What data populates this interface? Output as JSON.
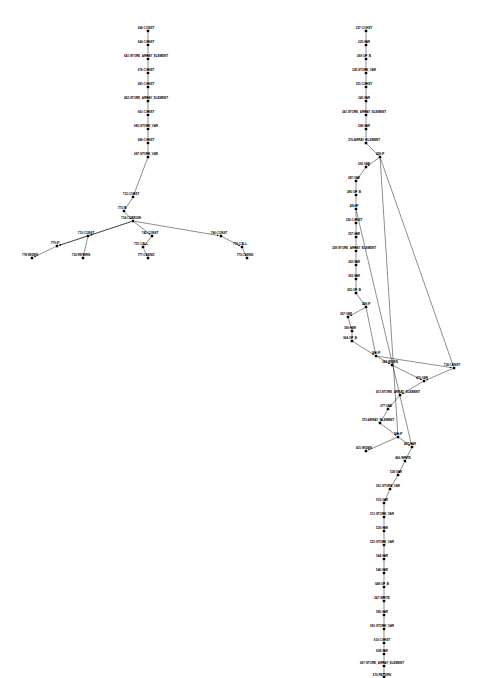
{
  "figure": {
    "kind": "control-flow-graph",
    "background": "#ffffff",
    "node_color": "#000000",
    "edge_color": "#000000",
    "node_shape": "square",
    "label_position": "left-of-node",
    "graph_count": 2,
    "note_bottom_node_clipped": true
  },
  "graphs": [
    {
      "id": "left-graph",
      "name": "left-control-flow-graph",
      "nodes": [
        {
          "id": "646",
          "label": "646:CONST",
          "x": 148,
          "y": 31,
          "lx": 146,
          "ly": 28.5,
          "anchor": "mid"
        },
        {
          "id": "640",
          "label": "640:CONST",
          "x": 148,
          "y": 45,
          "lx": 146,
          "ly": 42.5,
          "anchor": "mid"
        },
        {
          "id": "641",
          "label": "641:STORE_ARRAY_ELEMENT",
          "x": 148,
          "y": 59,
          "lx": 146,
          "ly": 56.5,
          "anchor": "mid"
        },
        {
          "id": "676",
          "label": "676:CONST",
          "x": 148,
          "y": 73,
          "lx": 146,
          "ly": 70.5,
          "anchor": "mid"
        },
        {
          "id": "681",
          "label": "681:CONST",
          "x": 148,
          "y": 87,
          "lx": 146,
          "ly": 84.5,
          "anchor": "mid"
        },
        {
          "id": "682",
          "label": "682:STORE_ARRAY_ELEMENT",
          "x": 148,
          "y": 101,
          "lx": 146,
          "ly": 98.5,
          "anchor": "mid"
        },
        {
          "id": "661",
          "label": "661:CONST",
          "x": 148,
          "y": 115,
          "lx": 146,
          "ly": 112.5,
          "anchor": "mid"
        },
        {
          "id": "680",
          "label": "680:STORE_VAR",
          "x": 148,
          "y": 129,
          "lx": 146,
          "ly": 126.5,
          "anchor": "mid"
        },
        {
          "id": "686",
          "label": "686:CONST",
          "x": 148,
          "y": 143,
          "lx": 146,
          "ly": 140.5,
          "anchor": "mid"
        },
        {
          "id": "687",
          "label": "687:STORE_VAR",
          "x": 148,
          "y": 157,
          "lx": 146,
          "ly": 154.5,
          "anchor": "mid"
        },
        {
          "id": "712",
          "label": "712:CONST",
          "x": 133,
          "y": 197,
          "lx": 131,
          "ly": 194.5,
          "anchor": "mid"
        },
        {
          "id": "773",
          "label": "773:IF",
          "x": 124,
          "y": 211,
          "lx": 122,
          "ly": 208.5,
          "anchor": "mid"
        },
        {
          "id": "714",
          "label": "714:CGBEGIN",
          "x": 133,
          "y": 221,
          "lx": 131,
          "ly": 218.5,
          "anchor": "mid"
        },
        {
          "id": "713",
          "label": "713:CONST",
          "x": 88,
          "y": 236,
          "lx": 86,
          "ly": 233.5,
          "anchor": "mid"
        },
        {
          "id": "742",
          "label": "742:CONST",
          "x": 152,
          "y": 236,
          "lx": 150,
          "ly": 233.5,
          "anchor": "mid"
        },
        {
          "id": "766",
          "label": "766:CONST",
          "x": 221,
          "y": 236,
          "lx": 219,
          "ly": 233.5,
          "anchor": "mid"
        },
        {
          "id": "779a",
          "label": "779:IF",
          "x": 57,
          "y": 246,
          "lx": 55,
          "ly": 243.5,
          "anchor": "mid"
        },
        {
          "id": "751",
          "label": "751:CALL",
          "x": 143,
          "y": 247,
          "lx": 141,
          "ly": 244.5,
          "anchor": "mid"
        },
        {
          "id": "776",
          "label": "776:CALL",
          "x": 242,
          "y": 247,
          "lx": 240,
          "ly": 244.5,
          "anchor": "mid"
        },
        {
          "id": "778",
          "label": "778:WIDEN",
          "x": 32,
          "y": 258,
          "lx": 30,
          "ly": 255.5,
          "anchor": "mid"
        },
        {
          "id": "732",
          "label": "732:RETURN",
          "x": 83,
          "y": 258,
          "lx": 81,
          "ly": 255.5,
          "anchor": "mid"
        },
        {
          "id": "777",
          "label": "777:CGEND",
          "x": 148,
          "y": 258,
          "lx": 146,
          "ly": 255.5,
          "anchor": "mid"
        },
        {
          "id": "775",
          "label": "775:CGEND",
          "x": 247,
          "y": 258,
          "lx": 245,
          "ly": 255.5,
          "anchor": "mid"
        }
      ],
      "edges": [
        [
          "646",
          "640"
        ],
        [
          "640",
          "641"
        ],
        [
          "641",
          "676"
        ],
        [
          "676",
          "681"
        ],
        [
          "681",
          "682"
        ],
        [
          "682",
          "661"
        ],
        [
          "661",
          "680"
        ],
        [
          "680",
          "686"
        ],
        [
          "686",
          "687"
        ],
        [
          "687",
          "712"
        ],
        [
          "712",
          "773"
        ],
        [
          "773",
          "714"
        ],
        [
          "714",
          "713"
        ],
        [
          "714",
          "742"
        ],
        [
          "714",
          "766"
        ],
        [
          "713",
          "779a"
        ],
        [
          "713",
          "732"
        ],
        [
          "742",
          "751"
        ],
        [
          "766",
          "776"
        ],
        [
          "779a",
          "778"
        ],
        [
          "751",
          "777"
        ],
        [
          "776",
          "775"
        ],
        [
          "714",
          "779a"
        ]
      ]
    },
    {
      "id": "right-graph",
      "name": "right-control-flow-graph",
      "nodes": [
        {
          "id": "227",
          "label": "227:CONST",
          "x": 366,
          "y": 31,
          "lx": 364,
          "ly": 28.5,
          "anchor": "mid"
        },
        {
          "id": "239",
          "label": "239:VAR",
          "x": 366,
          "y": 45,
          "lx": 364,
          "ly": 42.5,
          "anchor": "mid"
        },
        {
          "id": "299",
          "label": "299:OP_B",
          "x": 366,
          "y": 59,
          "lx": 364,
          "ly": 56.5,
          "anchor": "mid"
        },
        {
          "id": "338",
          "label": "338:STORE_VAR",
          "x": 366,
          "y": 73,
          "lx": 364,
          "ly": 70.5,
          "anchor": "mid"
        },
        {
          "id": "351",
          "label": "351:CONST",
          "x": 366,
          "y": 87,
          "lx": 364,
          "ly": 84.5,
          "anchor": "mid"
        },
        {
          "id": "342",
          "label": "342:VAR",
          "x": 366,
          "y": 101,
          "lx": 364,
          "ly": 98.5,
          "anchor": "mid"
        },
        {
          "id": "341",
          "label": "341:STORE_ARRAY_ELEMENT",
          "x": 366,
          "y": 115,
          "lx": 364,
          "ly": 112.5,
          "anchor": "mid"
        },
        {
          "id": "298",
          "label": "298:VAR",
          "x": 366,
          "y": 129,
          "lx": 364,
          "ly": 126.5,
          "anchor": "mid"
        },
        {
          "id": "276",
          "label": "276:ARRAY_ELEMENT",
          "x": 366,
          "y": 143,
          "lx": 364,
          "ly": 140.5,
          "anchor": "mid"
        },
        {
          "id": "328",
          "label": "328:IF",
          "x": 380,
          "y": 157,
          "lx": 380,
          "ly": 154.5,
          "anchor": "mid"
        },
        {
          "id": "292",
          "label": "292:VAR",
          "x": 366,
          "y": 167,
          "lx": 364,
          "ly": 164.5,
          "anchor": "mid"
        },
        {
          "id": "287",
          "label": "287:VAR",
          "x": 356,
          "y": 181,
          "lx": 354,
          "ly": 178.5,
          "anchor": "mid"
        },
        {
          "id": "286",
          "label": "286:OP_B",
          "x": 356,
          "y": 195,
          "lx": 354,
          "ly": 192.5,
          "anchor": "mid"
        },
        {
          "id": "426",
          "label": "426:IF",
          "x": 356,
          "y": 209,
          "lx": 354,
          "ly": 206.5,
          "anchor": "mid"
        },
        {
          "id": "336",
          "label": "336:CONST",
          "x": 356,
          "y": 223,
          "lx": 354,
          "ly": 220.5,
          "anchor": "mid"
        },
        {
          "id": "357",
          "label": "357:VAR",
          "x": 356,
          "y": 237,
          "lx": 354,
          "ly": 234.5,
          "anchor": "mid"
        },
        {
          "id": "328b",
          "label": "328:STORE_ARRAY_ELEMENT",
          "x": 356,
          "y": 251,
          "lx": 354,
          "ly": 248.5,
          "anchor": "mid"
        },
        {
          "id": "362",
          "label": "362:VAR",
          "x": 356,
          "y": 265,
          "lx": 354,
          "ly": 262.5,
          "anchor": "mid"
        },
        {
          "id": "363",
          "label": "363:VAR",
          "x": 356,
          "y": 279,
          "lx": 354,
          "ly": 276.5,
          "anchor": "mid"
        },
        {
          "id": "365",
          "label": "365:OP_B",
          "x": 356,
          "y": 293,
          "lx": 354,
          "ly": 290.5,
          "anchor": "mid"
        },
        {
          "id": "358",
          "label": "358:IF",
          "x": 366,
          "y": 307,
          "lx": 366,
          "ly": 304.5,
          "anchor": "mid"
        },
        {
          "id": "367",
          "label": "367:VAR",
          "x": 348,
          "y": 317,
          "lx": 346,
          "ly": 314.5,
          "anchor": "mid"
        },
        {
          "id": "360",
          "label": "360:VAR",
          "x": 352,
          "y": 331,
          "lx": 350,
          "ly": 328.5,
          "anchor": "mid"
        },
        {
          "id": "364",
          "label": "364:OP_B",
          "x": 352,
          "y": 341,
          "lx": 350,
          "ly": 338.5,
          "anchor": "mid"
        },
        {
          "id": "369",
          "label": "369:IF",
          "x": 376,
          "y": 356,
          "lx": 376,
          "ly": 353.5,
          "anchor": "mid"
        },
        {
          "id": "343",
          "label": "343:WIDEN",
          "x": 392,
          "y": 365,
          "lx": 390,
          "ly": 362.5,
          "anchor": "mid"
        },
        {
          "id": "718",
          "label": "718:CONST",
          "x": 454,
          "y": 368,
          "lx": 452,
          "ly": 365.5,
          "anchor": "mid"
        },
        {
          "id": "410",
          "label": "410:VAR",
          "x": 424,
          "y": 381,
          "lx": 422,
          "ly": 378.5,
          "anchor": "mid"
        },
        {
          "id": "411",
          "label": "411:STORE_ARRAY_ELEMENT",
          "x": 400,
          "y": 395,
          "lx": 398,
          "ly": 392.5,
          "anchor": "mid"
        },
        {
          "id": "377",
          "label": "377:VAR",
          "x": 388,
          "y": 409,
          "lx": 386,
          "ly": 406.5,
          "anchor": "mid"
        },
        {
          "id": "372",
          "label": "372:ARRAY_ELEMENT",
          "x": 380,
          "y": 423,
          "lx": 378,
          "ly": 420.5,
          "anchor": "mid"
        },
        {
          "id": "399",
          "label": "399:IF",
          "x": 398,
          "y": 437,
          "lx": 398,
          "ly": 434.5,
          "anchor": "mid"
        },
        {
          "id": "431",
          "label": "431:WIDEN",
          "x": 366,
          "y": 451,
          "lx": 364,
          "ly": 448.5,
          "anchor": "mid"
        },
        {
          "id": "467",
          "label": "467:VAR",
          "x": 412,
          "y": 447,
          "lx": 410,
          "ly": 444.5,
          "anchor": "mid"
        },
        {
          "id": "466",
          "label": "466:WRITE",
          "x": 405,
          "y": 461,
          "lx": 403,
          "ly": 458.5,
          "anchor": "mid"
        },
        {
          "id": "529",
          "label": "529:VAR",
          "x": 398,
          "y": 475,
          "lx": 396,
          "ly": 472.5,
          "anchor": "mid"
        },
        {
          "id": "561",
          "label": "561:STORE_VAR",
          "x": 390,
          "y": 489,
          "lx": 388,
          "ly": 486.5,
          "anchor": "mid"
        },
        {
          "id": "515",
          "label": "515:VAR",
          "x": 384,
          "y": 503,
          "lx": 382,
          "ly": 500.5,
          "anchor": "mid"
        },
        {
          "id": "511",
          "label": "511:STORE_VAR",
          "x": 384,
          "y": 517,
          "lx": 382,
          "ly": 514.5,
          "anchor": "mid"
        },
        {
          "id": "539",
          "label": "539:VAR",
          "x": 384,
          "y": 531,
          "lx": 382,
          "ly": 528.5,
          "anchor": "mid"
        },
        {
          "id": "521",
          "label": "521:STORE_VAR",
          "x": 384,
          "y": 545,
          "lx": 382,
          "ly": 542.5,
          "anchor": "mid"
        },
        {
          "id": "544",
          "label": "544:VAR",
          "x": 384,
          "y": 559,
          "lx": 382,
          "ly": 556.5,
          "anchor": "mid"
        },
        {
          "id": "546",
          "label": "546:VAR",
          "x": 384,
          "y": 573,
          "lx": 382,
          "ly": 570.5,
          "anchor": "mid"
        },
        {
          "id": "548",
          "label": "548:OP_B",
          "x": 384,
          "y": 587,
          "lx": 382,
          "ly": 584.5,
          "anchor": "mid"
        },
        {
          "id": "547",
          "label": "547:WRITE",
          "x": 384,
          "y": 601,
          "lx": 382,
          "ly": 598.5,
          "anchor": "mid"
        },
        {
          "id": "580",
          "label": "580:VAR",
          "x": 384,
          "y": 615,
          "lx": 382,
          "ly": 612.5,
          "anchor": "mid"
        },
        {
          "id": "581",
          "label": "581:STORE_VAR",
          "x": 384,
          "y": 629,
          "lx": 382,
          "ly": 626.5,
          "anchor": "mid"
        },
        {
          "id": "610",
          "label": "610:CONST",
          "x": 384,
          "y": 643,
          "lx": 382,
          "ly": 640.5,
          "anchor": "mid"
        },
        {
          "id": "608",
          "label": "608:VAR",
          "x": 384,
          "y": 654,
          "lx": 382,
          "ly": 651.5,
          "anchor": "mid"
        },
        {
          "id": "667",
          "label": "667:STORE_ARRAY_ELEMENT",
          "x": 384,
          "y": 666,
          "lx": 382,
          "ly": 663.5,
          "anchor": "mid"
        },
        {
          "id": "670",
          "label": "670:RETURN",
          "x": 384,
          "y": 677,
          "lx": 382,
          "ly": 675.5,
          "anchor": "mid"
        }
      ],
      "edges": [
        [
          "227",
          "239"
        ],
        [
          "239",
          "299"
        ],
        [
          "299",
          "338"
        ],
        [
          "338",
          "351"
        ],
        [
          "351",
          "342"
        ],
        [
          "342",
          "341"
        ],
        [
          "341",
          "298"
        ],
        [
          "298",
          "276"
        ],
        [
          "276",
          "328"
        ],
        [
          "328",
          "292"
        ],
        [
          "292",
          "287"
        ],
        [
          "287",
          "286"
        ],
        [
          "286",
          "426"
        ],
        [
          "426",
          "336"
        ],
        [
          "336",
          "357"
        ],
        [
          "357",
          "328b"
        ],
        [
          "328b",
          "362"
        ],
        [
          "362",
          "363"
        ],
        [
          "363",
          "365"
        ],
        [
          "365",
          "358"
        ],
        [
          "358",
          "367"
        ],
        [
          "367",
          "360"
        ],
        [
          "360",
          "364"
        ],
        [
          "364",
          "369"
        ],
        [
          "369",
          "343"
        ],
        [
          "343",
          "410"
        ],
        [
          "410",
          "411"
        ],
        [
          "411",
          "377"
        ],
        [
          "377",
          "372"
        ],
        [
          "372",
          "399"
        ],
        [
          "399",
          "431"
        ],
        [
          "399",
          "467"
        ],
        [
          "467",
          "466"
        ],
        [
          "466",
          "529"
        ],
        [
          "529",
          "561"
        ],
        [
          "561",
          "515"
        ],
        [
          "515",
          "511"
        ],
        [
          "511",
          "539"
        ],
        [
          "539",
          "521"
        ],
        [
          "521",
          "544"
        ],
        [
          "544",
          "546"
        ],
        [
          "546",
          "548"
        ],
        [
          "548",
          "547"
        ],
        [
          "547",
          "580"
        ],
        [
          "580",
          "581"
        ],
        [
          "581",
          "610"
        ],
        [
          "610",
          "608"
        ],
        [
          "608",
          "667"
        ],
        [
          "667",
          "670"
        ],
        [
          "328",
          "718"
        ],
        [
          "369",
          "718"
        ],
        [
          "718",
          "410"
        ],
        [
          "358",
          "369"
        ],
        [
          "426",
          "467"
        ],
        [
          "328",
          "399"
        ]
      ]
    }
  ]
}
